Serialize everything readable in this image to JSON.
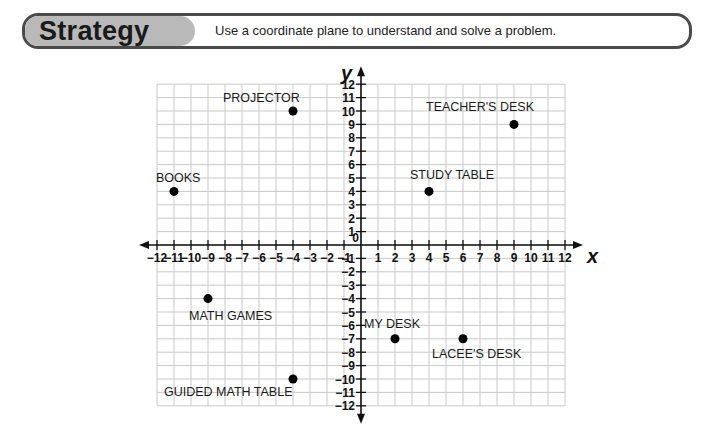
{
  "banner": {
    "title": "Strategy",
    "text": "Use a coordinate plane to understand and solve a problem."
  },
  "chart_data": {
    "type": "scatter",
    "title": "",
    "xlabel": "x",
    "ylabel": "y",
    "xlim": [
      -12,
      12
    ],
    "ylim": [
      -12,
      12
    ],
    "grid": true,
    "x_ticks": [
      -12,
      -11,
      -10,
      -9,
      -8,
      -7,
      -6,
      -5,
      -4,
      -3,
      -2,
      -1,
      1,
      2,
      3,
      4,
      5,
      6,
      7,
      8,
      9,
      10,
      11,
      12
    ],
    "y_ticks": [
      -12,
      -11,
      -10,
      -9,
      -8,
      -7,
      -6,
      -5,
      -4,
      -3,
      -2,
      -1,
      1,
      2,
      3,
      4,
      5,
      6,
      7,
      8,
      9,
      10,
      11,
      12
    ],
    "origin_label": "0",
    "points": [
      {
        "label": "PROJECTOR",
        "x": -4,
        "y": 10,
        "label_dx": -70,
        "label_dy": -9
      },
      {
        "label": "TEACHER'S DESK",
        "x": 9,
        "y": 9,
        "label_dx": -88,
        "label_dy": -13
      },
      {
        "label": "BOOKS",
        "x": -11,
        "y": 4,
        "label_dx": -18,
        "label_dy": -9
      },
      {
        "label": "STUDY TABLE",
        "x": 4,
        "y": 4,
        "label_dx": -19,
        "label_dy": -12
      },
      {
        "label": "MATH GAMES",
        "x": -9,
        "y": -4,
        "label_dx": -19,
        "label_dy": 21
      },
      {
        "label": "MY DESK",
        "x": 2,
        "y": -7,
        "label_dx": -31,
        "label_dy": -11
      },
      {
        "label": "LACEE'S DESK",
        "x": 6,
        "y": -7,
        "label_dx": -31,
        "label_dy": 19
      },
      {
        "label": "GUIDED MATH TABLE",
        "x": -4,
        "y": -10,
        "label_dx": -129,
        "label_dy": 17
      }
    ]
  }
}
